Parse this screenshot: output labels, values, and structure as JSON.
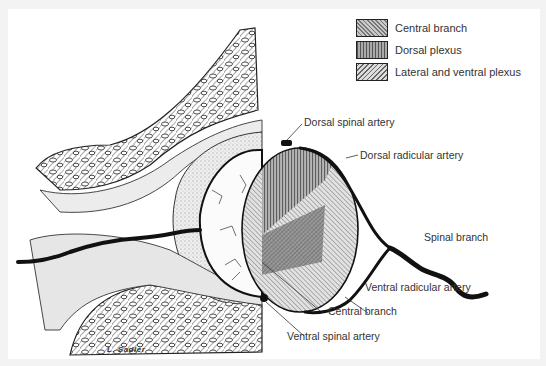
{
  "legend": {
    "items": [
      {
        "label": "Central branch",
        "pattern": "diagonal-hatch-dense"
      },
      {
        "label": "Dorsal plexus",
        "pattern": "vertical-lines"
      },
      {
        "label": "Lateral and ventral plexus",
        "pattern": "diagonal-hatch-light"
      }
    ]
  },
  "labels": {
    "dorsal_spinal_artery": "Dorsal spinal artery",
    "dorsal_radicular_artery": "Dorsal radicular artery",
    "spinal_branch": "Spinal branch",
    "ventral_radicular_artery": "Ventral radicular artery",
    "central_branch": "Central branch",
    "ventral_spinal_artery": "Ventral spinal artery"
  },
  "signature": "L. Sadler",
  "colors": {
    "background": "#ffffff",
    "ink": "#111111",
    "text": "#333333"
  }
}
